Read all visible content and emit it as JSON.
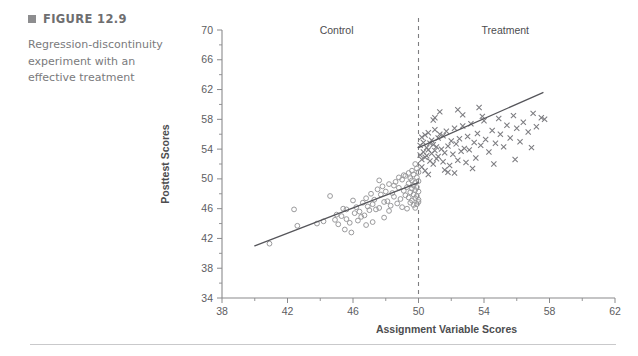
{
  "figure": {
    "bullet_icon": "square-bullet-icon",
    "number_label": "FIGURE 12.9",
    "caption": "Regression-discontinuity experiment with an effective treatment"
  },
  "chart_data": {
    "type": "scatter",
    "title": "",
    "xlabel": "Assignment Variable Scores",
    "ylabel": "Posttest Scores",
    "xlim": [
      38,
      62
    ],
    "ylim": [
      34,
      70
    ],
    "xticks": [
      38,
      42,
      46,
      50,
      54,
      58,
      62
    ],
    "yticks": [
      34,
      38,
      42,
      46,
      50,
      54,
      58,
      62,
      66,
      70
    ],
    "xtick_minor_step": 2,
    "ytick_minor_step": 2,
    "grid": false,
    "legend_position": "inside-top",
    "annotations": [
      {
        "name": "control-region-label",
        "text": "Control",
        "x": 45.0,
        "y": 69.5
      },
      {
        "name": "treatment-region-label",
        "text": "Treatment",
        "x": 55.3,
        "y": 69.5
      }
    ],
    "cutoff": {
      "name": "assignment-cutoff",
      "x": 50,
      "style": "dashed"
    },
    "series": [
      {
        "name": "Control",
        "marker": "open-circle",
        "color": "#9a9a9c",
        "fit_line": {
          "x": [
            40.0,
            50.0
          ],
          "y": [
            41.0,
            49.5
          ]
        },
        "points": [
          [
            40.9,
            41.3
          ],
          [
            42.4,
            45.9
          ],
          [
            42.6,
            43.7
          ],
          [
            43.8,
            44.0
          ],
          [
            44.2,
            44.3
          ],
          [
            44.6,
            47.7
          ],
          [
            44.9,
            44.5
          ],
          [
            45.0,
            45.2
          ],
          [
            45.1,
            43.9
          ],
          [
            45.3,
            45.0
          ],
          [
            45.4,
            46.0
          ],
          [
            45.5,
            43.2
          ],
          [
            45.6,
            44.6
          ],
          [
            45.6,
            45.9
          ],
          [
            45.8,
            44.1
          ],
          [
            46.0,
            47.1
          ],
          [
            46.1,
            45.4
          ],
          [
            46.2,
            46.2
          ],
          [
            46.3,
            44.4
          ],
          [
            46.4,
            45.6
          ],
          [
            46.5,
            44.9
          ],
          [
            46.6,
            46.8
          ],
          [
            46.7,
            45.1
          ],
          [
            46.8,
            47.4
          ],
          [
            46.9,
            46.3
          ],
          [
            47.0,
            45.8
          ],
          [
            47.1,
            48.0
          ],
          [
            47.2,
            46.6
          ],
          [
            47.3,
            47.2
          ],
          [
            47.4,
            45.9
          ],
          [
            47.5,
            48.6
          ],
          [
            47.6,
            46.1
          ],
          [
            47.7,
            47.9
          ],
          [
            47.8,
            49.0
          ],
          [
            47.9,
            46.9
          ],
          [
            48.0,
            48.3
          ],
          [
            48.1,
            47.0
          ],
          [
            48.2,
            49.3
          ],
          [
            48.3,
            46.4
          ],
          [
            48.4,
            48.1
          ],
          [
            48.5,
            47.6
          ],
          [
            48.6,
            49.6
          ],
          [
            48.7,
            46.7
          ],
          [
            48.8,
            48.8
          ],
          [
            48.9,
            47.3
          ],
          [
            49.0,
            49.9
          ],
          [
            49.0,
            46.2
          ],
          [
            49.1,
            48.4
          ],
          [
            49.2,
            47.8
          ],
          [
            49.2,
            50.4
          ],
          [
            49.3,
            46.0
          ],
          [
            49.3,
            48.9
          ],
          [
            49.4,
            47.5
          ],
          [
            49.4,
            49.4
          ],
          [
            49.5,
            46.8
          ],
          [
            49.5,
            48.2
          ],
          [
            49.5,
            50.1
          ],
          [
            49.6,
            47.1
          ],
          [
            49.6,
            48.7
          ],
          [
            49.6,
            49.8
          ],
          [
            49.7,
            46.5
          ],
          [
            49.7,
            47.9
          ],
          [
            49.7,
            49.1
          ],
          [
            49.7,
            50.6
          ],
          [
            49.8,
            47.4
          ],
          [
            49.8,
            48.5
          ],
          [
            49.8,
            49.5
          ],
          [
            49.8,
            46.1
          ],
          [
            49.9,
            47.7
          ],
          [
            49.9,
            48.9
          ],
          [
            49.9,
            50.2
          ],
          [
            49.9,
            46.6
          ],
          [
            50.0,
            47.2
          ],
          [
            50.0,
            48.3
          ],
          [
            50.0,
            49.7
          ],
          [
            50.0,
            46.9
          ],
          [
            50.0,
            50.9
          ],
          [
            49.9,
            51.4
          ],
          [
            49.8,
            52.0
          ],
          [
            49.6,
            51.1
          ],
          [
            49.4,
            50.8
          ],
          [
            49.1,
            50.5
          ],
          [
            48.8,
            50.2
          ],
          [
            48.5,
            49.1
          ],
          [
            48.2,
            45.7
          ],
          [
            47.9,
            44.8
          ],
          [
            47.6,
            49.8
          ],
          [
            47.2,
            44.2
          ],
          [
            46.8,
            43.8
          ],
          [
            45.9,
            42.8
          ]
        ]
      },
      {
        "name": "Treatment",
        "marker": "cross",
        "color": "#7c7c80",
        "fit_line": {
          "x": [
            50.0,
            57.6
          ],
          "y": [
            54.2,
            61.6
          ]
        },
        "points": [
          [
            50.1,
            54.5
          ],
          [
            50.1,
            53.2
          ],
          [
            50.2,
            55.6
          ],
          [
            50.2,
            52.6
          ],
          [
            50.3,
            54.9
          ],
          [
            50.3,
            53.6
          ],
          [
            50.4,
            55.9
          ],
          [
            50.4,
            52.9
          ],
          [
            50.5,
            54.2
          ],
          [
            50.5,
            53.1
          ],
          [
            50.6,
            56.2
          ],
          [
            50.6,
            53.9
          ],
          [
            50.7,
            54.8
          ],
          [
            50.7,
            52.4
          ],
          [
            50.8,
            55.2
          ],
          [
            50.8,
            53.4
          ],
          [
            50.9,
            54.6
          ],
          [
            50.9,
            52.0
          ],
          [
            51.0,
            56.6
          ],
          [
            51.0,
            53.8
          ],
          [
            51.1,
            54.3
          ],
          [
            51.1,
            52.7
          ],
          [
            51.2,
            55.5
          ],
          [
            51.2,
            53.0
          ],
          [
            51.3,
            56.0
          ],
          [
            51.4,
            54.0
          ],
          [
            51.5,
            52.3
          ],
          [
            51.5,
            55.8
          ],
          [
            51.6,
            53.5
          ],
          [
            51.7,
            56.4
          ],
          [
            51.8,
            54.4
          ],
          [
            51.9,
            51.8
          ],
          [
            52.0,
            55.1
          ],
          [
            52.1,
            53.3
          ],
          [
            52.2,
            56.8
          ],
          [
            52.3,
            54.7
          ],
          [
            52.4,
            52.5
          ],
          [
            52.5,
            55.4
          ],
          [
            52.6,
            53.7
          ],
          [
            52.7,
            57.1
          ],
          [
            52.8,
            54.1
          ],
          [
            52.9,
            52.2
          ],
          [
            53.0,
            55.7
          ],
          [
            53.1,
            53.9
          ],
          [
            53.2,
            57.4
          ],
          [
            53.4,
            54.9
          ],
          [
            53.5,
            52.8
          ],
          [
            53.6,
            56.1
          ],
          [
            53.8,
            54.5
          ],
          [
            54.0,
            57.8
          ],
          [
            54.1,
            55.3
          ],
          [
            54.3,
            53.6
          ],
          [
            54.5,
            56.5
          ],
          [
            54.7,
            54.8
          ],
          [
            54.9,
            58.1
          ],
          [
            55.0,
            56.0
          ],
          [
            55.2,
            54.3
          ],
          [
            55.4,
            57.2
          ],
          [
            55.6,
            55.5
          ],
          [
            55.8,
            58.5
          ],
          [
            56.0,
            56.8
          ],
          [
            56.2,
            55.0
          ],
          [
            56.4,
            57.6
          ],
          [
            56.7,
            56.3
          ],
          [
            57.0,
            58.8
          ],
          [
            57.2,
            57.0
          ],
          [
            57.5,
            58.2
          ],
          [
            57.7,
            58.0
          ],
          [
            51.3,
            59.0
          ],
          [
            52.7,
            58.6
          ],
          [
            53.9,
            58.4
          ],
          [
            50.9,
            57.9
          ],
          [
            50.2,
            51.6
          ],
          [
            50.4,
            51.1
          ],
          [
            51.8,
            50.9
          ],
          [
            53.3,
            51.4
          ],
          [
            54.6,
            52.0
          ],
          [
            55.9,
            52.6
          ],
          [
            56.9,
            54.2
          ],
          [
            51.0,
            58.2
          ],
          [
            52.4,
            59.3
          ],
          [
            53.7,
            59.6
          ],
          [
            50.6,
            50.6
          ],
          [
            51.6,
            51.2
          ],
          [
            52.2,
            50.8
          ]
        ]
      }
    ]
  }
}
